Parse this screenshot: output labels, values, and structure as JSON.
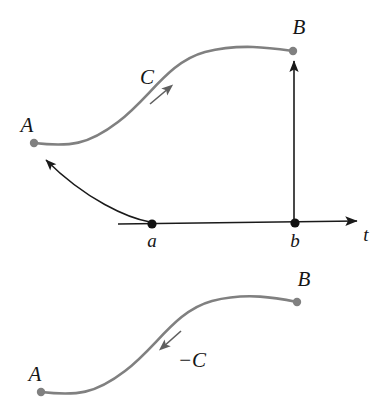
{
  "figure": {
    "background_color": "#ffffff",
    "curve_color": "#808080",
    "arrow_color": "#1a1a1a",
    "point_gray_color": "#808080",
    "point_black_color": "#111111",
    "panels": [
      {
        "id": "top-panel",
        "name": "parametrized-curve-panel",
        "points": [
          {
            "id": "A",
            "label": "A",
            "kind": "curve-endpoint",
            "color": "#808080"
          },
          {
            "id": "B",
            "label": "B",
            "kind": "curve-endpoint",
            "color": "#808080"
          },
          {
            "id": "a",
            "label": "a",
            "kind": "axis-parameter",
            "color": "#111111"
          },
          {
            "id": "b",
            "label": "b",
            "kind": "axis-parameter",
            "color": "#111111"
          }
        ],
        "curve_label": "C",
        "axis_label": "t",
        "axis_name": "parameter-axis"
      },
      {
        "id": "bottom-panel",
        "name": "reversed-curve-panel",
        "points": [
          {
            "id": "A",
            "label": "A",
            "kind": "curve-endpoint",
            "color": "#808080"
          },
          {
            "id": "B",
            "label": "B",
            "kind": "curve-endpoint",
            "color": "#808080"
          }
        ],
        "curve_label": "−C"
      }
    ]
  },
  "labels": {
    "top_A": "A",
    "top_B": "B",
    "top_C": "C",
    "axis_a": "a",
    "axis_b": "b",
    "axis_t": "t",
    "bottom_A": "A",
    "bottom_B": "B",
    "bottom_minus_C": "−C"
  }
}
